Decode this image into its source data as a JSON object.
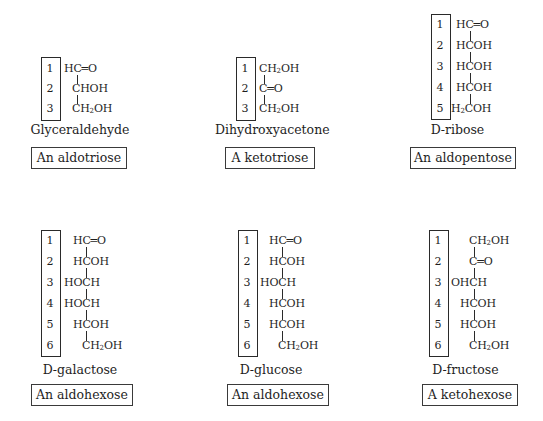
{
  "figure": {
    "structures": [
      {
        "id": "glyceraldehyde",
        "name": "Glyceraldehyde",
        "classification": "An aldotriose",
        "carbons": [
          {
            "n": "1",
            "pre": "",
            "post": "HC=O"
          },
          {
            "n": "2",
            "pre": "",
            "post": "CHOH"
          },
          {
            "n": "3",
            "pre": "",
            "post": "CH2OH"
          }
        ]
      },
      {
        "id": "dihydroxyacetone",
        "name": "Dihydroxyacetone",
        "classification": "A ketotriose",
        "carbons": [
          {
            "n": "1",
            "pre": "",
            "post": "CH2OH"
          },
          {
            "n": "2",
            "pre": "",
            "post": "C=O"
          },
          {
            "n": "3",
            "pre": "",
            "post": "CH2OH"
          }
        ]
      },
      {
        "id": "d-ribose",
        "name_prefix": "D",
        "name": "-ribose",
        "classification": "An aldopentose",
        "carbons": [
          {
            "n": "1",
            "post": "HC=O"
          },
          {
            "n": "2",
            "post": "HCOH"
          },
          {
            "n": "3",
            "post": "HCOH"
          },
          {
            "n": "4",
            "post": "HCOH"
          },
          {
            "n": "5",
            "post": "H2COH"
          }
        ]
      },
      {
        "id": "d-galactose",
        "name_prefix": "D",
        "name": "-galactose",
        "classification": "An aldohexose",
        "carbons": [
          {
            "n": "1",
            "post": "HC=O"
          },
          {
            "n": "2",
            "post": "HCOH"
          },
          {
            "n": "3",
            "post": "HOCH"
          },
          {
            "n": "4",
            "post": "HOCH"
          },
          {
            "n": "5",
            "post": "HCOH"
          },
          {
            "n": "6",
            "post": "CH2OH"
          }
        ]
      },
      {
        "id": "d-glucose",
        "name_prefix": "D",
        "name": "-glucose",
        "classification": "An aldohexose",
        "carbons": [
          {
            "n": "1",
            "post": "HC=O"
          },
          {
            "n": "2",
            "post": "HCOH"
          },
          {
            "n": "3",
            "post": "HOCH"
          },
          {
            "n": "4",
            "post": "HCOH"
          },
          {
            "n": "5",
            "post": "HCOH"
          },
          {
            "n": "6",
            "post": "CH2OH"
          }
        ]
      },
      {
        "id": "d-fructose",
        "name_prefix": "D",
        "name": "-fructose",
        "classification": "A ketohexose",
        "carbons": [
          {
            "n": "1",
            "post": "CH2OH"
          },
          {
            "n": "2",
            "post": "C=O"
          },
          {
            "n": "3",
            "post": "OHCH"
          },
          {
            "n": "4",
            "post": "HCOH"
          },
          {
            "n": "5",
            "post": "HCOH"
          },
          {
            "n": "6",
            "post": "CH2OH"
          }
        ]
      }
    ]
  }
}
